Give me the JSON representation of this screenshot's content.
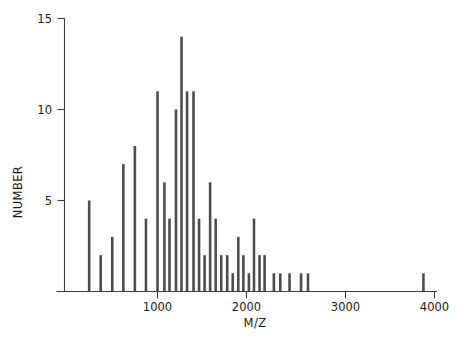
{
  "chart_data": {
    "type": "bar",
    "title": "",
    "subtitle": "",
    "xlabel": "M/Z",
    "ylabel": "NUMBER",
    "xlim": [
      0,
      4180
    ],
    "ylim": [
      0,
      15
    ],
    "x_ticks": [
      1000,
      2000,
      3000,
      4000
    ],
    "x_tick_labels": [
      "1000",
      "2000",
      "3000",
      "4000"
    ],
    "y_ticks": [
      5,
      10,
      15
    ],
    "y_tick_labels": [
      "5",
      "10",
      "15"
    ],
    "grid": false,
    "legend": null,
    "bar_color": "#4d4d4d",
    "axis_color": "#3c3c3c",
    "x": [
      260,
      385,
      510,
      630,
      755,
      875,
      1000,
      1075,
      1130,
      1200,
      1260,
      1320,
      1390,
      1450,
      1510,
      1570,
      1630,
      1690,
      1755,
      1815,
      1875,
      1930,
      1990,
      2045,
      2105,
      2160,
      2260,
      2330,
      2430,
      2555,
      2630,
      3880
    ],
    "values": [
      5,
      2,
      3,
      7,
      8,
      4,
      11,
      6,
      4,
      10,
      14,
      11,
      11,
      4,
      2,
      6,
      4,
      2,
      2,
      1,
      3,
      2,
      1,
      4,
      2,
      2,
      1,
      1,
      1,
      1,
      1,
      1
    ],
    "n_bars": 32
  },
  "axes": {
    "y_title": "NUMBER",
    "x_title": "M/Z",
    "y_tick_15": "15",
    "y_tick_10": "10",
    "y_tick_5": "5",
    "x_tick_1000": "1000",
    "x_tick_2000": "2000",
    "x_tick_3000": "3000",
    "x_tick_4000": "4000"
  }
}
